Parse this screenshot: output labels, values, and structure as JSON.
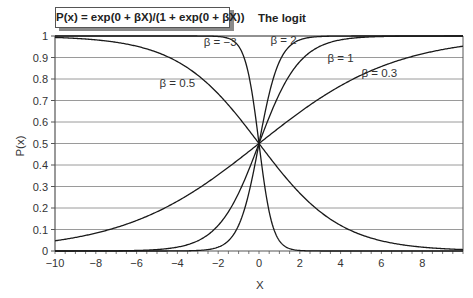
{
  "title": "P(x) = exp(0 + βX)/(1 + exp(0 + βX))",
  "subtitle": "The logit",
  "chart_data": {
    "type": "line",
    "title": "P(x) = exp(0 + βX)/(1 + exp(0 + βX))",
    "subtitle": "The logit",
    "xlabel": "X",
    "ylabel": "P(x)",
    "xlim": [
      -10,
      10
    ],
    "ylim": [
      0,
      1
    ],
    "x_ticks": [
      -10,
      -8,
      -6,
      -4,
      -2,
      0,
      2,
      4,
      6,
      8
    ],
    "y_ticks": [
      0,
      0.1,
      0.2,
      0.3,
      0.4,
      0.5,
      0.6,
      0.7,
      0.8,
      0.9,
      1
    ],
    "y_tick_labels": [
      "0",
      "0.1",
      "0.2",
      "0.3",
      "0.4",
      "0.5",
      "0.6",
      "0.7",
      "0.8",
      "0.9",
      "1"
    ],
    "grid": "horizontal",
    "legend": "inline labels",
    "series": [
      {
        "name": "β = −3",
        "beta": -3,
        "label": "β = −3",
        "label_pos": [
          -1.9,
          0.97
        ]
      },
      {
        "name": "β = 2",
        "beta": 2,
        "label": "β = 2",
        "label_pos": [
          1.2,
          0.98
        ]
      },
      {
        "name": "β = 1",
        "beta": 1,
        "label": "β = 1",
        "label_pos": [
          4.0,
          0.9
        ]
      },
      {
        "name": "β = 0.3",
        "beta": 0.3,
        "label": "β = 0.3",
        "label_pos": [
          5.9,
          0.83
        ]
      },
      {
        "name": "β = 0.5",
        "beta": -0.5,
        "label": "β = 0.5",
        "label_pos": [
          -4.0,
          0.78
        ]
      }
    ],
    "sample_points": {
      "x": [
        -10,
        -8,
        -6,
        -4,
        -2,
        0,
        2,
        4,
        6,
        8,
        10
      ],
      "beta_-3": [
        1.0,
        1.0,
        1.0,
        1.0,
        0.998,
        0.5,
        0.002,
        0.0,
        0.0,
        0.0,
        0.0
      ],
      "beta_2": [
        0.0,
        0.0,
        0.0,
        0.0,
        0.018,
        0.5,
        0.982,
        1.0,
        1.0,
        1.0,
        1.0
      ],
      "beta_1": [
        0.0,
        0.0,
        0.002,
        0.018,
        0.119,
        0.5,
        0.881,
        0.982,
        0.998,
        1.0,
        1.0
      ],
      "beta_0.3": [
        0.047,
        0.083,
        0.142,
        0.231,
        0.354,
        0.5,
        0.646,
        0.769,
        0.858,
        0.917,
        0.953
      ],
      "beta_0.5_label": [
        0.993,
        0.982,
        0.953,
        0.881,
        0.731,
        0.5,
        0.269,
        0.119,
        0.047,
        0.018,
        0.007
      ]
    }
  },
  "colors": {
    "curve": "#1a1a1a",
    "grid": "#9a9a9a",
    "axis": "#555555"
  }
}
